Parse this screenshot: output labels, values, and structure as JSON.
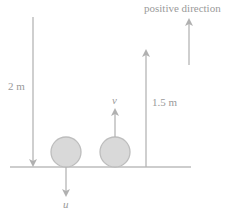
{
  "diagram": {
    "labels": {
      "positive_direction": "positive direction",
      "left_height": "2 m",
      "right_height": "1.5 m",
      "up_velocity": "v",
      "down_velocity": "u"
    },
    "colors": {
      "line": "#b5b5b5",
      "ball_fill": "#d9d9d9",
      "ball_stroke": "#bdbdbd",
      "text": "#9a9a9a"
    }
  }
}
